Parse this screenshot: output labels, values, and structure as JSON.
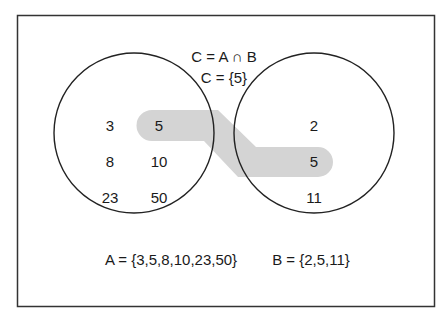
{
  "title": {
    "line1": "C = A ∩ B",
    "line2": "C = {5}"
  },
  "set_a": {
    "label": "A",
    "elements": [
      "3",
      "5",
      "8",
      "10",
      "23",
      "50"
    ],
    "definition": "A = {3,5,8,10,23,50}"
  },
  "set_b": {
    "label": "B",
    "elements": [
      "2",
      "5",
      "11"
    ],
    "definition": "B = {2,5,11}"
  },
  "intersection": {
    "label": "C",
    "elements": [
      "5"
    ],
    "highlight_color": "#d4d4d4"
  },
  "colors": {
    "stroke": "#1a1a1a",
    "background": "#ffffff"
  }
}
